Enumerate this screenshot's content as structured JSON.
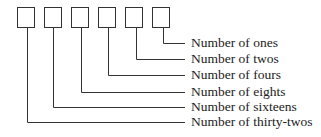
{
  "diagram": {
    "boxes": 6,
    "labels": [
      "Number of ones",
      "Number of twos",
      "Number of fours",
      "Number of eights",
      "Number of sixteens",
      "Number of thirty-twos"
    ],
    "stroke_color": "#333333"
  }
}
